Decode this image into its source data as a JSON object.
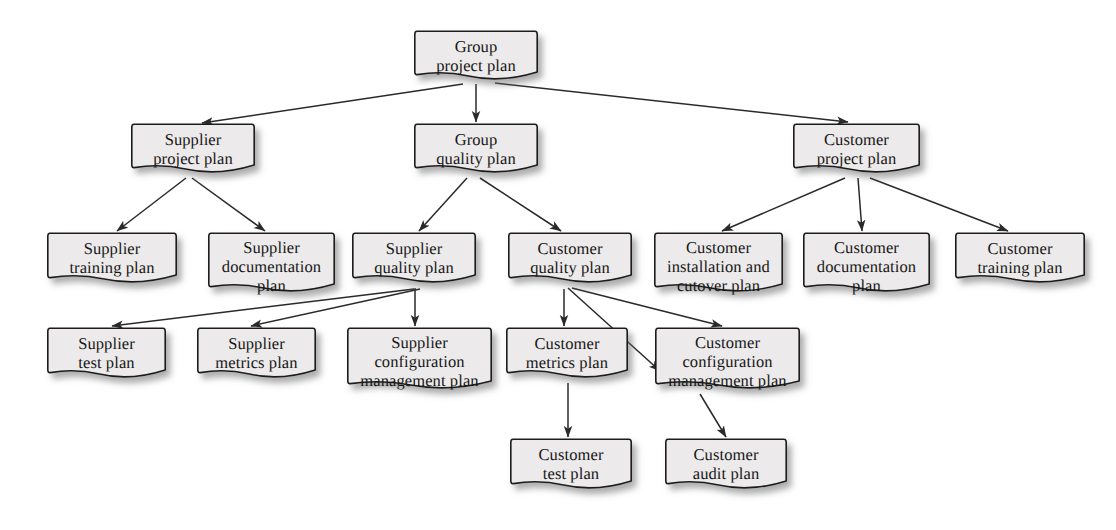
{
  "diagram": {
    "style": {
      "node_fill": "#eceaea",
      "node_stroke": "#1c1c1c",
      "edge_color": "#2a2a2a",
      "text_color": "#171717",
      "background": "#ffffff",
      "shadow_color": "rgba(90,90,90,0.45)"
    },
    "nodes": [
      {
        "id": "group-project-plan",
        "label": "Group\nproject plan",
        "lines": 2,
        "x": 414,
        "y": 30,
        "w": 124,
        "h": 52
      },
      {
        "id": "supplier-project-plan",
        "label": "Supplier\nproject plan",
        "lines": 2,
        "x": 131,
        "y": 123,
        "w": 124,
        "h": 52
      },
      {
        "id": "group-quality-plan",
        "label": "Group\nquality plan",
        "lines": 2,
        "x": 414,
        "y": 123,
        "w": 124,
        "h": 52
      },
      {
        "id": "customer-project-plan",
        "label": "Customer\nproject plan",
        "lines": 2,
        "x": 793,
        "y": 123,
        "w": 127,
        "h": 52
      },
      {
        "id": "supplier-training-plan",
        "label": "Supplier\ntraining plan",
        "lines": 2,
        "x": 47,
        "y": 232,
        "w": 130,
        "h": 53
      },
      {
        "id": "supplier-documentation-plan",
        "label": "Supplier\ndocumentation\nplan",
        "lines": 3,
        "x": 208,
        "y": 232,
        "w": 127,
        "h": 62
      },
      {
        "id": "supplier-quality-plan",
        "label": "Supplier\nquality plan",
        "lines": 2,
        "x": 352,
        "y": 232,
        "w": 124,
        "h": 53
      },
      {
        "id": "customer-quality-plan",
        "label": "Customer\nquality plan",
        "lines": 2,
        "x": 508,
        "y": 232,
        "w": 124,
        "h": 53
      },
      {
        "id": "customer-installation-cutover-plan",
        "label": "Customer\ninstallation and\ncutover plan",
        "lines": 3,
        "x": 654,
        "y": 232,
        "w": 129,
        "h": 62
      },
      {
        "id": "customer-documentation-plan",
        "label": "Customer\ndocumentation\nplan",
        "lines": 3,
        "x": 803,
        "y": 232,
        "w": 127,
        "h": 62
      },
      {
        "id": "customer-training-plan",
        "label": "Customer\ntraining plan",
        "lines": 2,
        "x": 955,
        "y": 232,
        "w": 130,
        "h": 53
      },
      {
        "id": "supplier-test-plan",
        "label": "Supplier\ntest plan",
        "lines": 2,
        "x": 47,
        "y": 327,
        "w": 119,
        "h": 53
      },
      {
        "id": "supplier-metrics-plan",
        "label": "Supplier\nmetrics plan",
        "lines": 2,
        "x": 197,
        "y": 327,
        "w": 119,
        "h": 53
      },
      {
        "id": "supplier-configuration-management-plan",
        "label": "Supplier\nconfiguration\nmanagement plan",
        "lines": 3,
        "x": 347,
        "y": 327,
        "w": 145,
        "h": 64
      },
      {
        "id": "customer-metrics-plan",
        "label": "Customer\nmetrics plan",
        "lines": 2,
        "x": 506,
        "y": 327,
        "w": 122,
        "h": 53
      },
      {
        "id": "customer-configuration-management-plan",
        "label": "Customer\nconfiguration\nmanagement plan",
        "lines": 3,
        "x": 655,
        "y": 327,
        "w": 145,
        "h": 64
      },
      {
        "id": "customer-test-plan",
        "label": "Customer\ntest plan",
        "lines": 2,
        "x": 510,
        "y": 438,
        "w": 122,
        "h": 53
      },
      {
        "id": "customer-audit-plan",
        "label": "Customer\naudit plan",
        "lines": 2,
        "x": 665,
        "y": 438,
        "w": 122,
        "h": 53
      }
    ],
    "edges": [
      {
        "from": "group-project-plan",
        "to": "supplier-project-plan",
        "x1": 463,
        "y1": 84,
        "x2": 202,
        "y2": 123
      },
      {
        "from": "group-project-plan",
        "to": "group-quality-plan",
        "x1": 476,
        "y1": 84,
        "x2": 476,
        "y2": 122
      },
      {
        "from": "group-project-plan",
        "to": "customer-project-plan",
        "x1": 495,
        "y1": 83,
        "x2": 848,
        "y2": 122
      },
      {
        "from": "supplier-project-plan",
        "to": "supplier-training-plan",
        "x1": 186,
        "y1": 178,
        "x2": 117,
        "y2": 231
      },
      {
        "from": "supplier-project-plan",
        "to": "supplier-documentation-plan",
        "x1": 192,
        "y1": 178,
        "x2": 265,
        "y2": 231
      },
      {
        "from": "group-quality-plan",
        "to": "supplier-quality-plan",
        "x1": 467,
        "y1": 178,
        "x2": 419,
        "y2": 231
      },
      {
        "from": "group-quality-plan",
        "to": "customer-quality-plan",
        "x1": 480,
        "y1": 178,
        "x2": 561,
        "y2": 231
      },
      {
        "from": "customer-project-plan",
        "to": "customer-installation-cutover-plan",
        "x1": 845,
        "y1": 178,
        "x2": 722,
        "y2": 231
      },
      {
        "from": "customer-project-plan",
        "to": "customer-documentation-plan",
        "x1": 858,
        "y1": 178,
        "x2": 862,
        "y2": 231
      },
      {
        "from": "customer-project-plan",
        "to": "customer-training-plan",
        "x1": 870,
        "y1": 178,
        "x2": 1008,
        "y2": 231
      },
      {
        "from": "supplier-quality-plan",
        "to": "supplier-test-plan",
        "x1": 414,
        "y1": 289,
        "x2": 112,
        "y2": 326
      },
      {
        "from": "supplier-quality-plan",
        "to": "supplier-metrics-plan",
        "x1": 420,
        "y1": 289,
        "x2": 251,
        "y2": 326
      },
      {
        "from": "supplier-quality-plan",
        "to": "supplier-configuration-management-plan",
        "x1": 415,
        "y1": 288,
        "x2": 415,
        "y2": 326
      },
      {
        "from": "customer-quality-plan",
        "to": "customer-metrics-plan",
        "x1": 564,
        "y1": 289,
        "x2": 564,
        "y2": 326
      },
      {
        "from": "customer-quality-plan",
        "to": "customer-configuration-management-plan",
        "x1": 572,
        "y1": 288,
        "x2": 722,
        "y2": 326
      },
      {
        "from": "customer-quality-plan",
        "to": "customer-configuration-management-plan-left",
        "x1": 568,
        "y1": 288,
        "x2": 660,
        "y2": 371
      },
      {
        "from": "customer-metrics-plan",
        "to": "customer-test-plan",
        "x1": 568,
        "y1": 383,
        "x2": 568,
        "y2": 437
      },
      {
        "from": "customer-configuration-management-plan",
        "to": "customer-audit-plan",
        "x1": 700,
        "y1": 394,
        "x2": 726,
        "y2": 437
      }
    ]
  }
}
